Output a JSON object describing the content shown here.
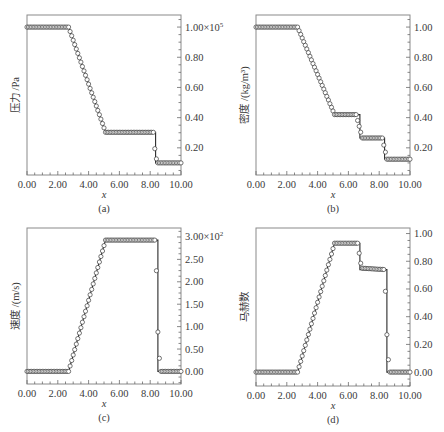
{
  "chart_data": [
    {
      "id": "a",
      "type": "line",
      "caption": "(a)",
      "xlabel": "x",
      "ylabel": "压力 /Pa",
      "y_multiplier_label": "×10",
      "y_multiplier_exp": "5",
      "xlim": [
        0,
        10
      ],
      "ylim": [
        0.02,
        1.08
      ],
      "xticks": [
        "0.00",
        "2.00",
        "4.00",
        "6.00",
        "8.00",
        "10.00"
      ],
      "yticks": [
        {
          "v": 1.0,
          "label": "1.00"
        },
        {
          "v": 0.8,
          "label": "0.80"
        },
        {
          "v": 0.6,
          "label": "0.60"
        },
        {
          "v": 0.4,
          "label": "0.40"
        },
        {
          "v": 0.2,
          "label": "0.20"
        }
      ],
      "series": [
        {
          "name": "exact",
          "style": "solid-line",
          "x": [
            0,
            2.7,
            5.1,
            8.35,
            8.35,
            10
          ],
          "y": [
            1.0,
            1.0,
            0.303,
            0.303,
            0.1,
            0.1
          ]
        },
        {
          "name": "numerical",
          "style": "open-circles",
          "x": [
            0,
            2.7,
            5.1,
            8.2,
            8.35,
            8.5,
            10
          ],
          "y": [
            1.0,
            1.0,
            0.303,
            0.303,
            0.14,
            0.1,
            0.1
          ]
        }
      ],
      "grid": false,
      "frame": {
        "left": 27,
        "top": 15,
        "right": 181,
        "bottom": 175
      }
    },
    {
      "id": "b",
      "type": "line",
      "caption": "(b)",
      "xlabel": "x",
      "ylabel": "密度 /(kg/m³)",
      "xlim": [
        0,
        10
      ],
      "ylim": [
        0.02,
        1.08
      ],
      "xticks": [
        "0.00",
        "2.00",
        "4.00",
        "6.00",
        "8.00",
        "10.00"
      ],
      "yticks": [
        {
          "v": 1.0,
          "label": "1.00"
        },
        {
          "v": 0.8,
          "label": "0.80"
        },
        {
          "v": 0.6,
          "label": "0.60"
        },
        {
          "v": 0.4,
          "label": "0.40"
        },
        {
          "v": 0.2,
          "label": "0.20"
        }
      ],
      "series": [
        {
          "name": "exact",
          "style": "solid-line",
          "x": [
            0,
            2.7,
            5.1,
            6.75,
            6.75,
            8.35,
            8.35,
            10
          ],
          "y": [
            1.0,
            1.0,
            0.42,
            0.42,
            0.265,
            0.265,
            0.125,
            0.125
          ]
        },
        {
          "name": "numerical",
          "style": "open-circles",
          "x": [
            0,
            2.7,
            5.1,
            6.5,
            6.9,
            8.2,
            8.5,
            10
          ],
          "y": [
            1.0,
            1.0,
            0.42,
            0.42,
            0.265,
            0.265,
            0.125,
            0.125
          ]
        }
      ],
      "grid": false,
      "frame": {
        "left": 256,
        "top": 15,
        "right": 410,
        "bottom": 175
      }
    },
    {
      "id": "c",
      "type": "line",
      "caption": "(c)",
      "xlabel": "x",
      "ylabel": "速度 /(m/s)",
      "y_multiplier_label": "×10",
      "y_multiplier_exp": "2",
      "xlim": [
        0,
        10
      ],
      "ylim": [
        -0.28,
        3.2
      ],
      "xticks": [
        "0.00",
        "2.00",
        "4.00",
        "6.00",
        "8.00",
        "10.00"
      ],
      "yticks": [
        {
          "v": 3.0,
          "label": "3.00"
        },
        {
          "v": 2.5,
          "label": "2.50"
        },
        {
          "v": 2.0,
          "label": "2.00"
        },
        {
          "v": 1.5,
          "label": "1.50"
        },
        {
          "v": 1.0,
          "label": "1.00"
        },
        {
          "v": 0.5,
          "label": "0.50"
        },
        {
          "v": 0.0,
          "label": "0.00"
        }
      ],
      "series": [
        {
          "name": "exact",
          "style": "solid-line",
          "x": [
            0,
            2.7,
            5.1,
            8.5,
            8.5,
            10
          ],
          "y": [
            0,
            0,
            2.93,
            2.93,
            0,
            0
          ]
        },
        {
          "name": "numerical",
          "style": "open-circles",
          "x": [
            0,
            2.7,
            5.1,
            8.35,
            8.5,
            8.65,
            10
          ],
          "y": [
            0,
            0,
            2.93,
            2.93,
            0.88,
            0,
            0
          ]
        }
      ],
      "grid": false,
      "frame": {
        "left": 27,
        "top": 228,
        "right": 181,
        "bottom": 384
      }
    },
    {
      "id": "d",
      "type": "line",
      "caption": "(d)",
      "xlabel": "x",
      "ylabel": "马赫数",
      "xlim": [
        0,
        10
      ],
      "ylim": [
        -0.1,
        1.04
      ],
      "xticks": [
        "0.00",
        "2.00",
        "4.00",
        "6.00",
        "8.00",
        "10.00"
      ],
      "yticks": [
        {
          "v": 1.0,
          "label": "1.00"
        },
        {
          "v": 0.8,
          "label": "0.80"
        },
        {
          "v": 0.6,
          "label": "0.60"
        },
        {
          "v": 0.4,
          "label": "0.40"
        },
        {
          "v": 0.2,
          "label": "0.20"
        },
        {
          "v": 0.0,
          "label": "0.00"
        }
      ],
      "series": [
        {
          "name": "exact",
          "style": "solid-line",
          "x": [
            0,
            2.7,
            5.1,
            6.75,
            6.75,
            8.5,
            8.5,
            10
          ],
          "y": [
            0,
            0,
            0.93,
            0.93,
            0.74,
            0.74,
            0,
            0
          ]
        },
        {
          "name": "numerical",
          "style": "open-circles",
          "x": [
            0,
            2.7,
            5.1,
            6.6,
            6.85,
            8.35,
            8.5,
            8.65,
            10
          ],
          "y": [
            0,
            0,
            0.93,
            0.93,
            0.75,
            0.74,
            0.27,
            0,
            0
          ]
        }
      ],
      "grid": false,
      "frame": {
        "left": 256,
        "top": 228,
        "right": 410,
        "bottom": 386
      }
    }
  ]
}
